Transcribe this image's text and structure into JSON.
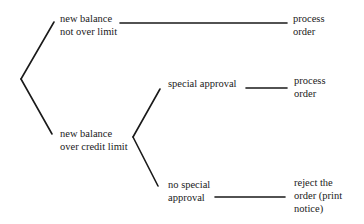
{
  "diagram": {
    "type": "decision-tree",
    "nodes": {
      "cond_not_over": {
        "label": "new balance\nnot over limit"
      },
      "cond_over": {
        "label": "new balance\nover credit limit"
      },
      "cond_special": {
        "label": "special approval"
      },
      "cond_no_special": {
        "label": "no special\napproval"
      },
      "action_process_1": {
        "label": "process\norder"
      },
      "action_process_2": {
        "label": "process\norder"
      },
      "action_reject": {
        "label": "reject the\norder (print\nnotice)"
      }
    },
    "edges": [
      {
        "from": "root",
        "to": "cond_not_over"
      },
      {
        "from": "root",
        "to": "cond_over"
      },
      {
        "from": "cond_not_over",
        "to": "action_process_1"
      },
      {
        "from": "cond_over",
        "to": "cond_special"
      },
      {
        "from": "cond_over",
        "to": "cond_no_special"
      },
      {
        "from": "cond_special",
        "to": "action_process_2"
      },
      {
        "from": "cond_no_special",
        "to": "action_reject"
      }
    ],
    "colors": {
      "ink": "#1a1a1a",
      "background": "#ffffff"
    }
  }
}
